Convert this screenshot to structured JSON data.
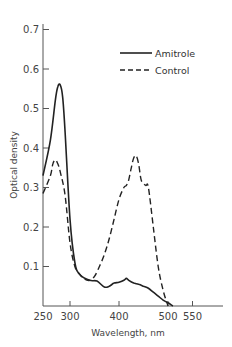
{
  "chart_data": {
    "type": "line",
    "title": "",
    "xlabel": "Wavelength, nm",
    "ylabel": "Optical density",
    "xlim": [
      250,
      580
    ],
    "ylim": [
      0,
      0.72
    ],
    "x_ticks": [
      250,
      300,
      400,
      500,
      550
    ],
    "x_tick_labels": [
      "250",
      "300",
      "400",
      "500",
      "550"
    ],
    "y_ticks": [
      0.1,
      0.2,
      0.3,
      0.4,
      0.5,
      0.6,
      0.7
    ],
    "y_tick_labels": [
      "0.1",
      "0.2",
      "0.3",
      "0.4",
      "0.5",
      "0.6",
      "0.7"
    ],
    "grid": false,
    "legend_position": "upper right",
    "series": [
      {
        "name": "Amitrole",
        "style": "solid",
        "x": [
          250,
          260,
          270,
          275,
          280,
          285,
          290,
          300,
          310,
          320,
          340,
          355,
          370,
          380,
          390,
          400,
          410,
          415,
          420,
          430,
          440,
          450,
          460,
          470,
          480,
          490,
          500,
          510
        ],
        "y": [
          0.33,
          0.42,
          0.52,
          0.555,
          0.56,
          0.53,
          0.44,
          0.22,
          0.11,
          0.08,
          0.065,
          0.063,
          0.048,
          0.05,
          0.058,
          0.06,
          0.065,
          0.07,
          0.065,
          0.058,
          0.055,
          0.05,
          0.045,
          0.035,
          0.025,
          0.015,
          0.008,
          0.0
        ]
      },
      {
        "name": "Control",
        "style": "dashed",
        "x": [
          250,
          260,
          265,
          270,
          275,
          280,
          290,
          300,
          310,
          320,
          330,
          340,
          350,
          360,
          370,
          380,
          390,
          400,
          410,
          415,
          420,
          425,
          430,
          435,
          440,
          445,
          450,
          455,
          460,
          470,
          480,
          490,
          500
        ],
        "y": [
          0.285,
          0.33,
          0.36,
          0.37,
          0.36,
          0.34,
          0.28,
          0.16,
          0.1,
          0.08,
          0.068,
          0.065,
          0.075,
          0.1,
          0.13,
          0.17,
          0.22,
          0.27,
          0.3,
          0.305,
          0.32,
          0.35,
          0.375,
          0.38,
          0.36,
          0.32,
          0.31,
          0.305,
          0.3,
          0.2,
          0.1,
          0.04,
          0.0
        ]
      }
    ]
  },
  "legend": {
    "items": [
      {
        "label": "Amitrole",
        "style": "solid"
      },
      {
        "label": "Control",
        "style": "dashed"
      }
    ]
  },
  "axes": {
    "xlabel": "Wavelength, nm",
    "ylabel": "Optical density"
  }
}
